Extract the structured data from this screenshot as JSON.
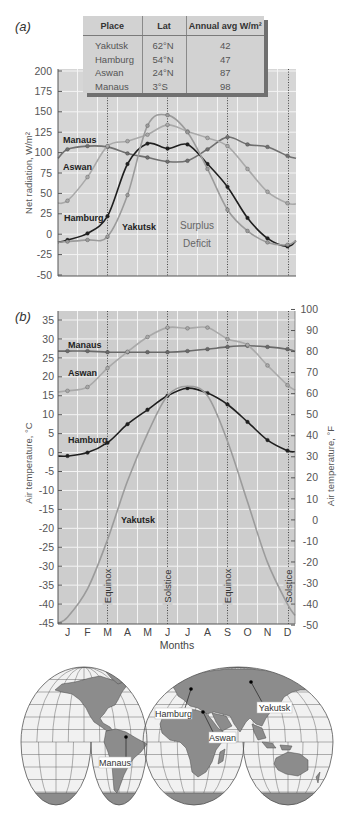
{
  "figure": {
    "panel_a_label": "(a)",
    "panel_b_label": "(b)"
  },
  "table": {
    "headers": [
      "Place",
      "Lat",
      "Annual avg W/m²"
    ],
    "rows": [
      {
        "place": "Yakutsk",
        "lat": "62°N",
        "annual_avg": "42"
      },
      {
        "place": "Hamburg",
        "lat": "54°N",
        "annual_avg": "47"
      },
      {
        "place": "Aswan",
        "lat": "24°N",
        "annual_avg": "87"
      },
      {
        "place": "Manaus",
        "lat": "3°S",
        "annual_avg": "98"
      }
    ]
  },
  "chart_data": [
    {
      "panel": "(a)",
      "type": "line",
      "title": "",
      "xlabel": "",
      "ylabel": "Net radiation, W/m²",
      "ylim": [
        -50,
        200
      ],
      "yticks": [
        200,
        175,
        150,
        125,
        100,
        75,
        50,
        25,
        0,
        -25,
        -50
      ],
      "categories": [
        "J",
        "F",
        "M",
        "A",
        "M",
        "J",
        "J",
        "A",
        "S",
        "O",
        "N",
        "D"
      ],
      "grid": true,
      "series": [
        {
          "name": "Manaus",
          "color": "#707070",
          "markers": true,
          "start": 93,
          "values": [
            104,
            108,
            107,
            99,
            94,
            89,
            90,
            104,
            119,
            110,
            107,
            96
          ],
          "end": 93
        },
        {
          "name": "Aswan",
          "color": "#a9a9a9",
          "markers": true,
          "start": 38,
          "values": [
            41,
            70,
            108,
            114,
            122,
            134,
            126,
            118,
            108,
            80,
            52,
            38
          ],
          "end": 37
        },
        {
          "name": "Hamburg",
          "color": "#1f1f1f",
          "markers": true,
          "start": -10,
          "values": [
            -7,
            1,
            22,
            86,
            111,
            105,
            110,
            86,
            58,
            20,
            -5,
            -15
          ],
          "end": -8
        },
        {
          "name": "Yakutsk",
          "color": "#9b9b9b",
          "markers": true,
          "start": -10,
          "values": [
            -9,
            -7,
            -3,
            48,
            133,
            146,
            125,
            80,
            30,
            4,
            -10,
            -13
          ],
          "end": -8
        }
      ],
      "annotations": {
        "surplus": "Surplus",
        "deficit": "Deficit"
      },
      "vertical_markers": [
        {
          "month_index": 2.0
        },
        {
          "month_index": 5.0
        },
        {
          "month_index": 8.0
        },
        {
          "month_index": 11.05
        }
      ]
    },
    {
      "panel": "(b)",
      "type": "line",
      "title": "",
      "xlabel": "Months",
      "ylabel": "Air temperature, °C",
      "ylabel_right": "Air temperature, °F",
      "ylim": [
        -45,
        35
      ],
      "yticks": [
        35,
        30,
        25,
        20,
        15,
        10,
        5,
        0,
        -5,
        -10,
        -15,
        -20,
        -25,
        -30,
        -35,
        -40,
        -45
      ],
      "yticks_right": [
        100,
        90,
        80,
        70,
        60,
        50,
        40,
        30,
        20,
        10,
        0,
        -10,
        -20,
        -30,
        -40,
        -50
      ],
      "categories": [
        "J",
        "F",
        "M",
        "A",
        "M",
        "J",
        "J",
        "A",
        "S",
        "O",
        "N",
        "D"
      ],
      "grid": true,
      "series": [
        {
          "name": "Manaus",
          "color": "#6a6a6a",
          "markers": true,
          "start": 26.8,
          "values": [
            26.8,
            26.8,
            26.5,
            26.5,
            26.5,
            26.5,
            26.8,
            27.3,
            27.9,
            28.2,
            27.9,
            27.3
          ],
          "end": 26.8
        },
        {
          "name": "Aswan",
          "color": "#a9a9a9",
          "markers": true,
          "start": 16.0,
          "values": [
            16.3,
            17.3,
            22.3,
            26.6,
            30.5,
            33.0,
            32.8,
            33.0,
            30.0,
            28.4,
            23.0,
            17.8
          ],
          "end": 16.5
        },
        {
          "name": "Hamburg",
          "color": "#1f1f1f",
          "markers": true,
          "start": -0.9,
          "values": [
            -0.9,
            0.0,
            2.6,
            7.5,
            11.3,
            15.0,
            17.0,
            15.7,
            12.7,
            8.1,
            3.3,
            0.5
          ],
          "end": 0.2
        },
        {
          "name": "Yakutsk",
          "color": "#9b9b9b",
          "markers": false,
          "start": -45,
          "values": [
            -43.5,
            -36,
            -23,
            -7.5,
            5,
            15,
            17.5,
            15,
            3,
            -13,
            -29,
            -40
          ],
          "end": -43
        }
      ],
      "vertical_markers": [
        {
          "label": "Equinox",
          "month_index": 2.0
        },
        {
          "label": "Solstice",
          "month_index": 5.0
        },
        {
          "label": "Equinox",
          "month_index": 8.0
        },
        {
          "label": "Solstice",
          "month_index": 11.05
        }
      ]
    }
  ],
  "map": {
    "cities": [
      {
        "name": "Hamburg"
      },
      {
        "name": "Aswan"
      },
      {
        "name": "Yakutsk"
      },
      {
        "name": "Manaus"
      }
    ],
    "colors": {
      "land": "#8c8c8c",
      "ocean": "#f1f1f1",
      "grid": "#555555"
    }
  }
}
